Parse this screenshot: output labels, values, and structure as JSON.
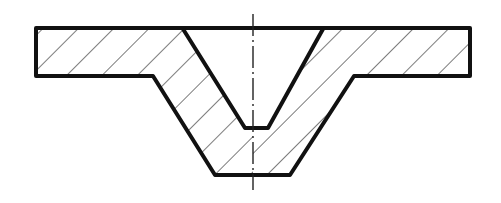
{
  "diagram": {
    "type": "engineering-section-view",
    "colors": {
      "background": "#ffffff",
      "outline": "#111111",
      "hatch": "#222222"
    },
    "outer_profile": [
      [
        36,
        28
      ],
      [
        470,
        28
      ],
      [
        470,
        76
      ],
      [
        354,
        76
      ],
      [
        290,
        175
      ],
      [
        215,
        175
      ],
      [
        153,
        76
      ],
      [
        36,
        76
      ]
    ],
    "inner_recess": [
      [
        183,
        29
      ],
      [
        245,
        128
      ],
      [
        268,
        128
      ],
      [
        323,
        29
      ]
    ],
    "left_section": [
      [
        36,
        28
      ],
      [
        183,
        28
      ],
      [
        245,
        128
      ],
      [
        268,
        128
      ],
      [
        268,
        175
      ],
      [
        215,
        175
      ],
      [
        153,
        76
      ],
      [
        36,
        76
      ]
    ],
    "right_section": [
      [
        323,
        28
      ],
      [
        470,
        28
      ],
      [
        470,
        76
      ],
      [
        354,
        76
      ],
      [
        290,
        175
      ],
      [
        268,
        175
      ],
      [
        268,
        128
      ]
    ],
    "centerline": {
      "x": 253,
      "y_start": 14,
      "y_end": 190,
      "style": "dash-dot"
    },
    "hatch": {
      "angle_deg": 45,
      "spacing_px": 25
    }
  }
}
